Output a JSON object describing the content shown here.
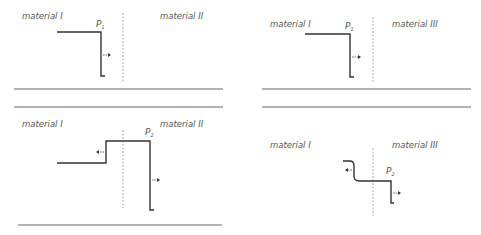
{
  "figure": {
    "panels": [
      {
        "id": "top-left",
        "left_material": "material I",
        "right_material": "material II",
        "pulse_label": "P",
        "pulse_sub": "1"
      },
      {
        "id": "top-right",
        "left_material": "material I",
        "right_material": "material III",
        "pulse_label": "P",
        "pulse_sub": "1"
      },
      {
        "id": "bottom-left",
        "left_material": "material I",
        "right_material": "material II",
        "pulse_label": "P",
        "pulse_sub": "2"
      },
      {
        "id": "bottom-right",
        "left_material": "material I",
        "right_material": "material III",
        "pulse_label": "P",
        "pulse_sub": "2"
      }
    ],
    "colors": {
      "wave": "#333333",
      "interface": "#999999",
      "rule": "#555555",
      "text": "#555555"
    }
  }
}
